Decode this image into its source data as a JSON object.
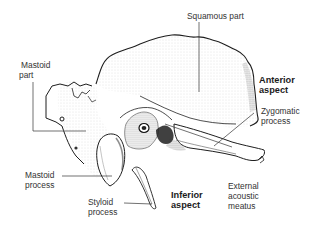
{
  "figure": {
    "labels": {
      "squamous_part": "Squamous part",
      "mastoid_part_l1": "Mastoid",
      "mastoid_part_l2": "part",
      "anterior_aspect_l1": "Anterior",
      "anterior_aspect_l2": "aspect",
      "zygomatic_process_l1": "Zygomatic",
      "zygomatic_process_l2": "process",
      "mastoid_process_l1": "Mastoid",
      "mastoid_process_l2": "process",
      "styloid_process_l1": "Styloid",
      "styloid_process_l2": "process",
      "inferior_aspect_l1": "Inferior",
      "inferior_aspect_l2": "aspect",
      "external_acoustic_meatus_l1": "External",
      "external_acoustic_meatus_l2": "acoustic",
      "external_acoustic_meatus_l3": "meatus"
    },
    "colors": {
      "line": "#1e1e1e",
      "stipple": "#5a5a5a",
      "text": "#333333",
      "background": "#ffffff"
    }
  }
}
